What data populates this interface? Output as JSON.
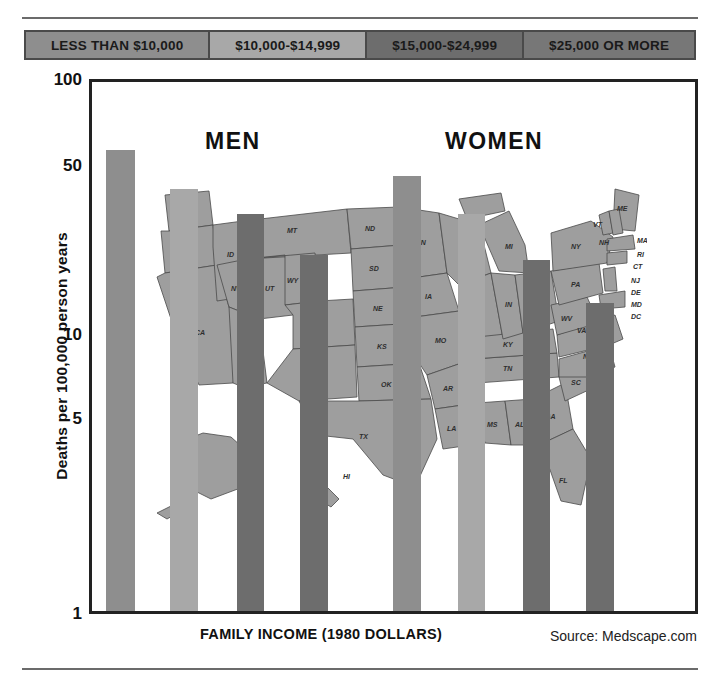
{
  "legend": {
    "items": [
      {
        "label": "LESS THAN $10,000",
        "color": "#8e8e8e"
      },
      {
        "label": "$10,000-$14,999",
        "color": "#a8a8a8"
      },
      {
        "label": "$15,000-$24,999",
        "color": "#6d6d6d"
      },
      {
        "label": "$25,000 OR MORE",
        "color": "#777777"
      }
    ]
  },
  "groups": {
    "men_label": "MEN",
    "women_label": "WOMEN"
  },
  "axis": {
    "ylabel": "Deaths per 100,000 person years",
    "xlabel": "FAMILY INCOME (1980 DOLLARS)",
    "yticks": [
      "100",
      "50",
      "10",
      "5",
      "1"
    ]
  },
  "source": "Source: Medscape.com",
  "chart_data": {
    "type": "bar",
    "title": "",
    "xlabel": "FAMILY INCOME (1980 DOLLARS)",
    "ylabel": "Deaths per 100,000 person years",
    "yscale": "log",
    "ylim": [
      1,
      100
    ],
    "ytick_values": [
      100,
      50,
      10,
      5,
      1
    ],
    "grid": false,
    "legend_position": "top",
    "categories": [
      "LESS THAN $10,000",
      "$10,000-$14,999",
      "$15,000-$24,999",
      "$25,000 OR MORE"
    ],
    "groups": [
      "MEN",
      "WOMEN"
    ],
    "series": [
      {
        "name": "MEN",
        "values": [
          58,
          41,
          33,
          23
        ]
      },
      {
        "name": "WOMEN",
        "values": [
          46,
          33,
          22,
          15
        ]
      }
    ],
    "bars": [
      {
        "group": "MEN",
        "category": "LESS THAN $10,000",
        "value": 58,
        "color": "#8e8e8e"
      },
      {
        "group": "MEN",
        "category": "$10,000-$14,999",
        "value": 41,
        "color": "#a8a8a8"
      },
      {
        "group": "MEN",
        "category": "$15,000-$24,999",
        "value": 33,
        "color": "#6d6d6d"
      },
      {
        "group": "MEN",
        "category": "$25,000 OR MORE",
        "value": 23,
        "color": "#6d6d6d"
      },
      {
        "group": "WOMEN",
        "category": "LESS THAN $10,000",
        "value": 46,
        "color": "#8e8e8e"
      },
      {
        "group": "WOMEN",
        "category": "$10,000-$14,999",
        "value": 33,
        "color": "#a8a8a8"
      },
      {
        "group": "WOMEN",
        "category": "$15,000-$24,999",
        "value": 22,
        "color": "#6d6d6d"
      },
      {
        "group": "WOMEN",
        "category": "$25,000 OR MORE",
        "value": 15,
        "color": "#6d6d6d"
      }
    ],
    "annotations": [
      "MEN",
      "WOMEN",
      "Source: Medscape.com"
    ],
    "background_image": "united-states-map"
  }
}
